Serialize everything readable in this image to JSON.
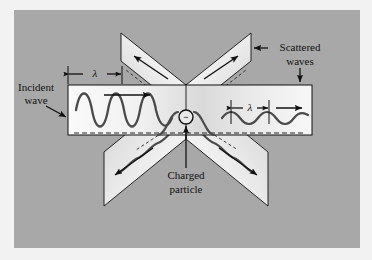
{
  "figure": {
    "background_color": "#a8a8a8",
    "outer_margin_color": "#f2f2f2",
    "panel_fill_light": "#f4f4f4",
    "panel_fill_mid": "#d8d8d8",
    "stroke_color": "#111111",
    "wave_color": "#3a3a3a"
  },
  "labels": {
    "incident_wave_line1": "Incident",
    "incident_wave_line2": "wave",
    "scattered_waves_line1": "Scattered",
    "scattered_waves_line2": "waves",
    "charged_particle_line1": "Charged",
    "charged_particle_line2": "particle",
    "wavelength_left": "λ",
    "wavelength_right": "λ",
    "particle_charge_sign": "−"
  },
  "physics": {
    "incident_wavelength_px": 52,
    "scattered_wavelength_px": 38,
    "incident_amplitude_px": 20,
    "scattered_amplitude_px": 7,
    "scatter_plane_count": 4,
    "scatter_directions": [
      "up-left",
      "up-right",
      "down-left",
      "down-right"
    ],
    "particle_charge": "negative"
  },
  "geometry": {
    "gray_field": {
      "x": 14,
      "y": 10,
      "w": 346,
      "h": 238
    },
    "horizontal_panel": {
      "x": 68,
      "y": 85,
      "w": 244,
      "h": 50
    },
    "center": {
      "x": 186,
      "y": 85
    },
    "particle": {
      "x": 186,
      "y": 117,
      "r": 7
    }
  }
}
